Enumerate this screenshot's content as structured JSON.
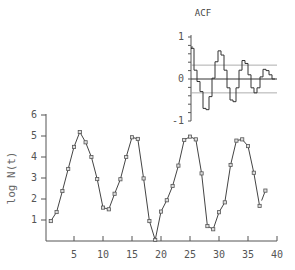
{
  "chart_data": [
    {
      "id": "main",
      "type": "line",
      "title": "",
      "xlabel": "",
      "ylabel": "log N(t)",
      "xlim": [
        0,
        40
      ],
      "ylim": [
        0,
        6
      ],
      "xticks": [
        5,
        10,
        15,
        20,
        25,
        30,
        35,
        40
      ],
      "yticks": [
        1,
        2,
        3,
        4,
        5,
        6
      ],
      "marker": "square",
      "grid": false,
      "x": [
        1,
        2,
        3,
        4,
        5,
        6,
        7,
        8,
        9,
        10,
        11,
        12,
        13,
        14,
        15,
        16,
        17,
        18,
        19,
        20,
        21,
        22,
        23,
        24,
        25,
        26,
        27,
        28,
        29,
        30,
        31,
        32,
        33,
        34,
        35,
        36,
        37,
        38
      ],
      "values": [
        0.95,
        1.38,
        2.38,
        3.43,
        4.48,
        5.19,
        4.7,
        4.0,
        2.95,
        1.59,
        1.51,
        2.25,
        2.94,
        4.0,
        4.94,
        4.86,
        2.98,
        0.95,
        0.05,
        1.4,
        1.94,
        2.62,
        3.59,
        4.81,
        4.97,
        4.84,
        3.22,
        0.71,
        0.56,
        1.37,
        1.84,
        3.62,
        4.78,
        4.84,
        4.52,
        3.25,
        1.67,
        2.4
      ],
      "gap_between": [
        37,
        38
      ]
    },
    {
      "id": "acf",
      "type": "bar",
      "style": "step",
      "title": "ACF",
      "ylim": [
        -1,
        1
      ],
      "yticks": [
        1,
        0,
        -1
      ],
      "ytick_labels": [
        "1",
        "0",
        "-1"
      ],
      "confidence_band": [
        -0.33,
        0.33
      ],
      "lags": 30,
      "values": [
        0.73,
        0.21,
        -0.06,
        -0.3,
        -0.7,
        -0.73,
        -0.42,
        0.02,
        0.41,
        0.67,
        0.57,
        0.21,
        -0.21,
        -0.5,
        -0.54,
        -0.21,
        0.21,
        0.44,
        0.37,
        0.1,
        -0.21,
        -0.33,
        -0.21,
        0.05,
        0.23,
        0.2,
        0.1,
        0.0
      ]
    }
  ]
}
